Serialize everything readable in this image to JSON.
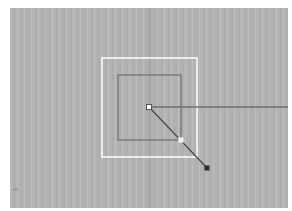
{
  "viewport": {
    "name": "perspective-viewport",
    "background": "#b4b4b4",
    "colors": {
      "grid_axis": "#8c8c8c",
      "selection_box": "#ffffff",
      "object_outline": "#6e6e6e",
      "ray_line": "#5a5a5a",
      "handle_fill": "#ffffff",
      "endpoint": "#2a2a2a"
    }
  },
  "objects": {
    "outer_square": {
      "x": 92,
      "y": 50,
      "w": 95,
      "h": 99
    },
    "inner_square": {
      "x": 108,
      "y": 67,
      "w": 63,
      "h": 65
    },
    "center_point": {
      "x": 139,
      "y": 99
    },
    "horizontal_line_end": {
      "x": 278,
      "y": 99
    },
    "midpoint_handle": {
      "x": 171,
      "y": 132
    },
    "end_point": {
      "x": 197,
      "y": 160
    }
  }
}
